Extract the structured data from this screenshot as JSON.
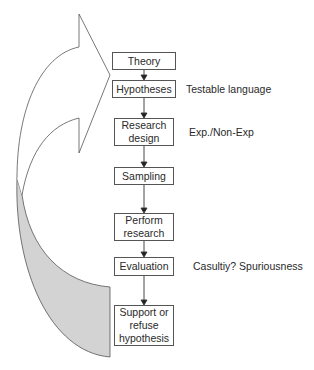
{
  "diagram": {
    "type": "flowchart",
    "steps": [
      {
        "label": "Theory"
      },
      {
        "label": "Hypotheses",
        "note": "Testable language"
      },
      {
        "label": "Research design",
        "note": "Exp./Non-Exp"
      },
      {
        "label": "Sampling"
      },
      {
        "label": "Perform research"
      },
      {
        "label": "Evaluation",
        "note": "Casultiy? Spuriousness"
      },
      {
        "label": "Support or refuse hypothesis"
      }
    ],
    "feedback_arrow": {
      "from": "Support or refuse hypothesis",
      "to": "Theory",
      "style": "curved-block-arrow",
      "fill_shadow": "#d3d3d3"
    },
    "colors": {
      "stroke": "#555555",
      "shadow": "#d3d3d3",
      "text": "#2a2a2a"
    }
  }
}
